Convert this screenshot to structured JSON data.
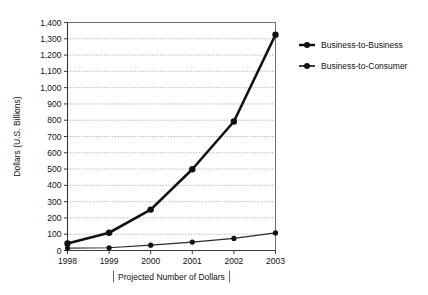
{
  "chart_data": {
    "type": "line",
    "title": "",
    "xlabel": "Projected Number of Dollars",
    "ylabel": "Dollars (U.S. Billions)",
    "categories": [
      "1998",
      "1999",
      "2000",
      "2001",
      "2002",
      "2003"
    ],
    "x": [
      1998,
      1999,
      2000,
      2001,
      2002,
      2003
    ],
    "xlim": [
      1998,
      2003
    ],
    "ylim": [
      0,
      1400
    ],
    "ytick_step": 100,
    "yticks": [
      0,
      100,
      200,
      300,
      400,
      500,
      600,
      700,
      800,
      900,
      1000,
      1100,
      1200,
      1300,
      1400
    ],
    "ytick_labels": [
      "0",
      "100",
      "200",
      "300",
      "400",
      "500",
      "600",
      "700",
      "800",
      "900",
      "1,000",
      "1,100",
      "1,200",
      "1,300",
      "1,400"
    ],
    "grid": true,
    "grid_axis": "y",
    "legend_position": "right",
    "series": [
      {
        "name": "Business-to-Business",
        "values": [
          43,
          109,
          251,
          499,
          792,
          1325
        ],
        "marker": "circle",
        "line_weight": "thick"
      },
      {
        "name": "Business-to-Consumer",
        "values": [
          15,
          17,
          33,
          52,
          74,
          108
        ],
        "marker": "circle",
        "line_weight": "thin"
      }
    ]
  },
  "legend": {
    "entries": [
      {
        "label": "Business-to-Business"
      },
      {
        "label": "Business-to-Consumer"
      }
    ]
  },
  "colors": {
    "series_b2b": "#111111",
    "series_b2c": "#2a2a2a",
    "grid": "#8a8a8a",
    "frame": "#6e6e6e",
    "text": "#111111",
    "background": "#ffffff"
  }
}
